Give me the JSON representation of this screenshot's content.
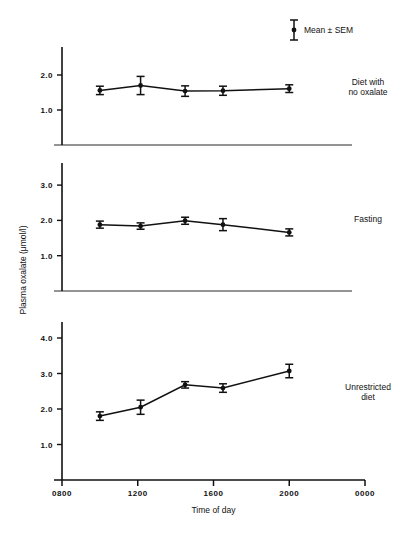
{
  "figure": {
    "legend": {
      "symbol": "errorbar-marker-icon",
      "label": "Mean ± SEM"
    },
    "y_axis_title": "Plasma oxalate (μmol/l)",
    "x_axis_title": "Time of day",
    "ink_color": "#111111"
  },
  "chart_data": {
    "type": "line",
    "title": "",
    "xlabel": "Time of day",
    "ylabel": "Plasma oxalate (μmol/l)",
    "xlim": [
      800,
      2400
    ],
    "x_tick_labels": [
      "0800",
      "1200",
      "1600",
      "2000",
      "0000"
    ],
    "x_tick_values": [
      800,
      1200,
      1600,
      2000,
      2400
    ],
    "x": [
      1000,
      1215,
      1450,
      1650,
      2000
    ],
    "grid": false,
    "legend_position": "top-right",
    "error_bars": "SEM",
    "panels": [
      {
        "name": "diet-with-no-oxalate",
        "label": "Diet with\nno oxalate",
        "label_line1": "Diet with",
        "label_line2": "no oxalate",
        "ylim": [
          0.0,
          2.55
        ],
        "y_ticks": [
          1.0,
          2.0
        ],
        "y_tick_labels": [
          "1.0",
          "2.0"
        ],
        "values": [
          1.56,
          1.7,
          1.54,
          1.55,
          1.61
        ],
        "errors": [
          0.12,
          0.26,
          0.15,
          0.13,
          0.11
        ]
      },
      {
        "name": "fasting",
        "label": "Fasting",
        "label_line1": "Fasting",
        "label_line2": "",
        "ylim": [
          0.0,
          3.45
        ],
        "y_ticks": [
          1.0,
          2.0,
          3.0
        ],
        "y_tick_labels": [
          "1.0",
          "2.0",
          "3.0"
        ],
        "values": [
          1.88,
          1.84,
          1.99,
          1.88,
          1.66
        ],
        "errors": [
          0.1,
          0.09,
          0.1,
          0.17,
          0.1
        ]
      },
      {
        "name": "unrestricted-diet",
        "label": "Unrestricted\ndiet",
        "label_line1": "Unrestricted",
        "label_line2": "diet",
        "ylim": [
          0.0,
          4.55
        ],
        "y_ticks": [
          1.0,
          2.0,
          3.0,
          4.0
        ],
        "y_tick_labels": [
          "1.0",
          "2.0",
          "3.0",
          "4.0"
        ],
        "values": [
          1.8,
          2.05,
          2.68,
          2.59,
          3.07
        ],
        "errors": [
          0.12,
          0.2,
          0.09,
          0.12,
          0.19
        ]
      }
    ]
  }
}
